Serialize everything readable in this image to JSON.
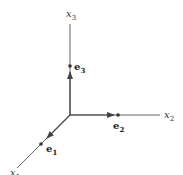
{
  "diagram": {
    "type": "coordinate-axes-3d",
    "colors": {
      "axis": "#555555",
      "text": "#222222",
      "background": "#ffffff"
    },
    "origin": {
      "x": 70,
      "y": 115
    },
    "axes": [
      {
        "id": "x1",
        "label": "x",
        "subscript": "1",
        "end": {
          "x": 17,
          "y": 168
        }
      },
      {
        "id": "x2",
        "label": "x",
        "subscript": "2",
        "end": {
          "x": 160,
          "y": 115
        }
      },
      {
        "id": "x3",
        "label": "x",
        "subscript": "3",
        "end": {
          "x": 70,
          "y": 24
        }
      }
    ],
    "basis_vectors": [
      {
        "id": "e1",
        "label": "e",
        "subscript": "1",
        "point": {
          "x": 41,
          "y": 144
        }
      },
      {
        "id": "e2",
        "label": "e",
        "subscript": "2",
        "point": {
          "x": 118,
          "y": 115
        }
      },
      {
        "id": "e3",
        "label": "e",
        "subscript": "3",
        "point": {
          "x": 70,
          "y": 66
        }
      }
    ]
  }
}
